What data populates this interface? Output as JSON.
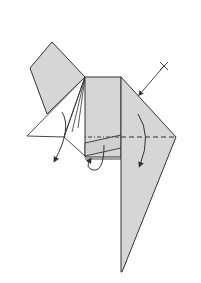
{
  "diagram": {
    "type": "origami-fold-instruction",
    "colors": {
      "paper_fill": "#d6d6d6",
      "paper_white": "#ffffff",
      "line": "#333333",
      "background": "#ffffff"
    },
    "elements": [
      {
        "name": "upper-left-flap",
        "kind": "shaded-quadrilateral"
      },
      {
        "name": "left-white-triangle",
        "kind": "white-triangle"
      },
      {
        "name": "center-rectangle",
        "kind": "shaded-rectangle"
      },
      {
        "name": "right-long-flap",
        "kind": "shaded-polygon"
      },
      {
        "name": "valley-fold-line",
        "kind": "dashed-line"
      },
      {
        "name": "pinch-mark-arrow",
        "kind": "arrow-with-x"
      },
      {
        "name": "fold-down-arrow-right",
        "kind": "curved-arrow"
      },
      {
        "name": "fold-down-arrow-left",
        "kind": "curved-arrow"
      },
      {
        "name": "fold-behind-arrow-center",
        "kind": "curved-arrow"
      }
    ]
  }
}
